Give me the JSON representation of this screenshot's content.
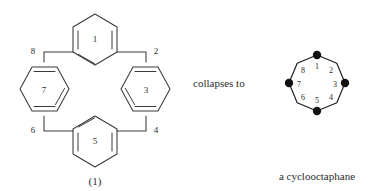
{
  "figure": {
    "label": "(1)",
    "phrase": "collapses to",
    "caption": "a cyclooctaphane",
    "line_color": "#3a3a3a",
    "dot_color": "#111111",
    "background": "#ffffff"
  },
  "cyclophane": {
    "name": "cyclophane-structure-1",
    "ring_labels": [
      "1",
      "3",
      "5",
      "7"
    ],
    "bridge_labels": [
      "2",
      "4",
      "6",
      "8"
    ],
    "rings": [
      {
        "id": "ring-1",
        "label": "1",
        "position": "top",
        "cx": 95,
        "cy": 38,
        "orientation": "pointy-vertical"
      },
      {
        "id": "ring-3",
        "label": "3",
        "position": "right",
        "cx": 146,
        "cy": 89,
        "orientation": "pointy-horizontal"
      },
      {
        "id": "ring-5",
        "label": "5",
        "position": "bottom",
        "cx": 95,
        "cy": 140,
        "orientation": "pointy-vertical"
      },
      {
        "id": "ring-7",
        "label": "7",
        "position": "left",
        "cx": 44,
        "cy": 89,
        "orientation": "pointy-horizontal"
      }
    ],
    "bridges": [
      {
        "id": "bridge-2",
        "label": "2",
        "corner": "top-right",
        "lx": 152,
        "ly": 52
      },
      {
        "id": "bridge-4",
        "label": "4",
        "corner": "bottom-right",
        "lx": 152,
        "ly": 131
      },
      {
        "id": "bridge-6",
        "label": "6",
        "corner": "bottom-left",
        "lx": 33,
        "ly": 131
      },
      {
        "id": "bridge-8",
        "label": "8",
        "corner": "top-left",
        "lx": 33,
        "ly": 52
      }
    ]
  },
  "cyclooctaphane": {
    "name": "cyclooctaphane-octagon",
    "vertex_labels": [
      "1",
      "2",
      "3",
      "4",
      "5",
      "6",
      "7",
      "8"
    ],
    "center": {
      "cx": 317,
      "cy": 83
    },
    "radius": 28,
    "filled_vertices": [
      "1",
      "3",
      "5",
      "7"
    ],
    "open_vertices": [
      "2",
      "4",
      "6",
      "8"
    ],
    "vertices": [
      {
        "label": "1",
        "angle_deg": 270,
        "filled": true,
        "lx": 317,
        "ly": 65
      },
      {
        "label": "2",
        "angle_deg": 315,
        "filled": false,
        "lx": 334,
        "ly": 71
      },
      {
        "label": "3",
        "angle_deg": 0,
        "filled": true,
        "lx": 338,
        "ly": 87
      },
      {
        "label": "4",
        "angle_deg": 45,
        "filled": false,
        "lx": 334,
        "ly": 102
      },
      {
        "label": "5",
        "angle_deg": 90,
        "filled": true,
        "lx": 317,
        "ly": 107
      },
      {
        "label": "6",
        "angle_deg": 135,
        "filled": false,
        "lx": 300,
        "ly": 102
      },
      {
        "label": "7",
        "angle_deg": 180,
        "filled": true,
        "lx": 296,
        "ly": 87
      },
      {
        "label": "8",
        "angle_deg": 225,
        "filled": false,
        "lx": 300,
        "ly": 71
      }
    ]
  }
}
